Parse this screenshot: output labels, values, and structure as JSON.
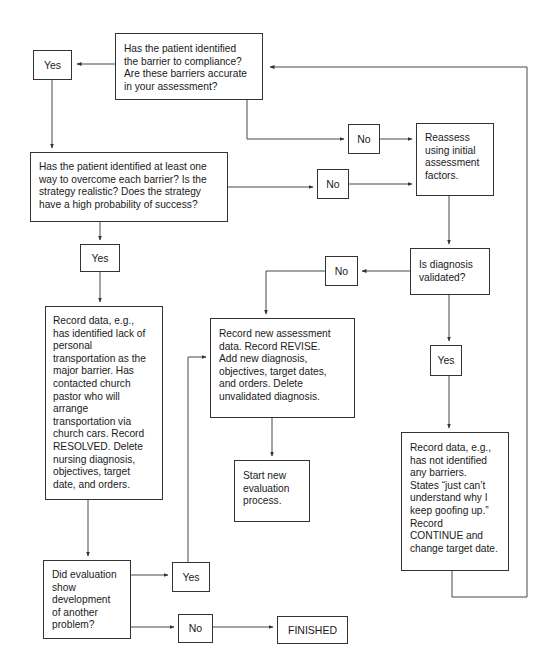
{
  "diagram": {
    "nodes": {
      "q_barrier": {
        "text": "Has the patient identified\nthe barrier to compliance?\nAre these barriers accurate\nin your assessment?"
      },
      "yes_barrier": {
        "text": "Yes"
      },
      "no_barrier": {
        "text": "No"
      },
      "reassess": {
        "text": "Reassess\nusing initial\nassessment\nfactors."
      },
      "q_strategy": {
        "text": "Has the patient identified at least one\nway to overcome each barrier? Is the\nstrategy realistic? Does the strategy\nhave a high probability of success?"
      },
      "no_strategy": {
        "text": "No"
      },
      "yes_strategy": {
        "text": "Yes"
      },
      "q_diagnosis": {
        "text": "Is diagnosis\nvalidated?"
      },
      "no_diagnosis": {
        "text": "No"
      },
      "yes_diagnosis": {
        "text": "Yes"
      },
      "record_resolved": {
        "text": "Record data, e.g.,\nhas identified lack of\npersonal\ntransportation as the\nmajor barrier. Has\ncontacted church\npastor who will\narrange\ntransportation via\nchurch cars. Record\nRESOLVED. Delete\nnursing diagnosis,\nobjectives, target\ndate, and orders."
      },
      "record_revise": {
        "text": "Record new assessment\ndata. Record REVISE.\nAdd new diagnosis,\nobjectives, target dates,\nand orders. Delete\nunvalidated diagnosis."
      },
      "start_new": {
        "text": "Start new\nevaluation\nprocess."
      },
      "record_continue": {
        "text": "Record data, e.g.,\nhas not identified\nany barriers.\nStates “just can’t\nunderstand why I\nkeep goofing up.”\nRecord\nCONTINUE and\nchange target date."
      },
      "q_another_problem": {
        "text": "Did evaluation\nshow\ndevelopment\nof another\nproblem?"
      },
      "yes_another": {
        "text": "Yes"
      },
      "no_another": {
        "text": "No"
      },
      "finished": {
        "text": "FINISHED"
      }
    },
    "colors": {
      "line": "#333333",
      "background": "#ffffff",
      "text": "#1a1a1a"
    }
  }
}
